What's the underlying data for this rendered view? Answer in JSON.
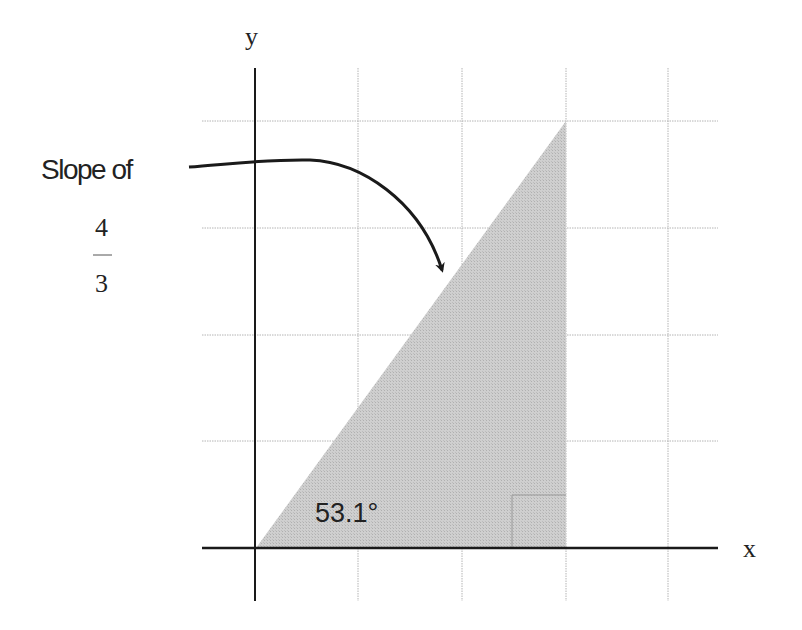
{
  "diagram": {
    "axis_labels": {
      "x": "x",
      "y": "y"
    },
    "annotation": {
      "text": "Slope of",
      "fraction": {
        "numerator": "4",
        "denominator": "3"
      }
    },
    "angle_label": "53.1°",
    "triangle": {
      "rise": 4,
      "run": 3,
      "angle_degrees": 53.1,
      "right_angle_marker": true,
      "fill_color": "#c8c8c8"
    },
    "grid": {
      "columns_shown": 4,
      "rows_shown": 4,
      "line_color": "#b4b4b4"
    },
    "colors": {
      "axis": "#1a1a1a",
      "arrow": "#1a1a1a",
      "background": "#ffffff"
    }
  }
}
